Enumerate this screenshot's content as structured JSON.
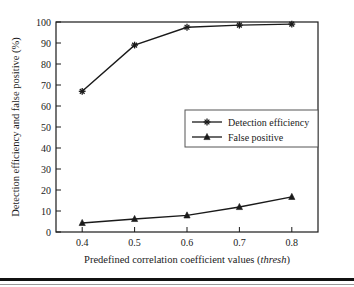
{
  "figure": {
    "background_color": "#ffffff",
    "frame_color": "#1a1a1a",
    "series_color": "#1a1a1a"
  },
  "axes": {
    "x_title_main": "Predefined correlation coefficient values (",
    "x_title_italic": "thresh",
    "x_title_close": ")",
    "y_title": "Detection efficiency and false positive (%)",
    "x_ticks": [
      "0.4",
      "0.5",
      "0.6",
      "0.7",
      "0.8"
    ],
    "y_ticks": [
      "0",
      "10",
      "20",
      "30",
      "40",
      "50",
      "60",
      "70",
      "80",
      "90",
      "100"
    ]
  },
  "legend": {
    "entries": [
      {
        "label": "Detection efficiency",
        "marker": "star-marker"
      },
      {
        "label": "False positive",
        "marker": "triangle-marker"
      }
    ]
  },
  "chart_data": {
    "type": "line",
    "title": "",
    "xlabel": "Predefined correlation coefficient values (thresh)",
    "ylabel": "Detection efficiency and false positive (%)",
    "x": [
      0.4,
      0.5,
      0.6,
      0.7,
      0.8
    ],
    "xlim": [
      0.35,
      0.85
    ],
    "ylim": [
      0,
      100
    ],
    "y_tick_step": 10,
    "x_tick_values": [
      0.4,
      0.5,
      0.6,
      0.7,
      0.8
    ],
    "grid": false,
    "legend_position": "center-right",
    "series": [
      {
        "name": "Detection efficiency",
        "marker": "star",
        "values": [
          67,
          89,
          97.5,
          98.5,
          99
        ]
      },
      {
        "name": "False positive",
        "marker": "triangle",
        "values": [
          4.3,
          6.2,
          7.9,
          11.9,
          16.7
        ]
      }
    ]
  }
}
